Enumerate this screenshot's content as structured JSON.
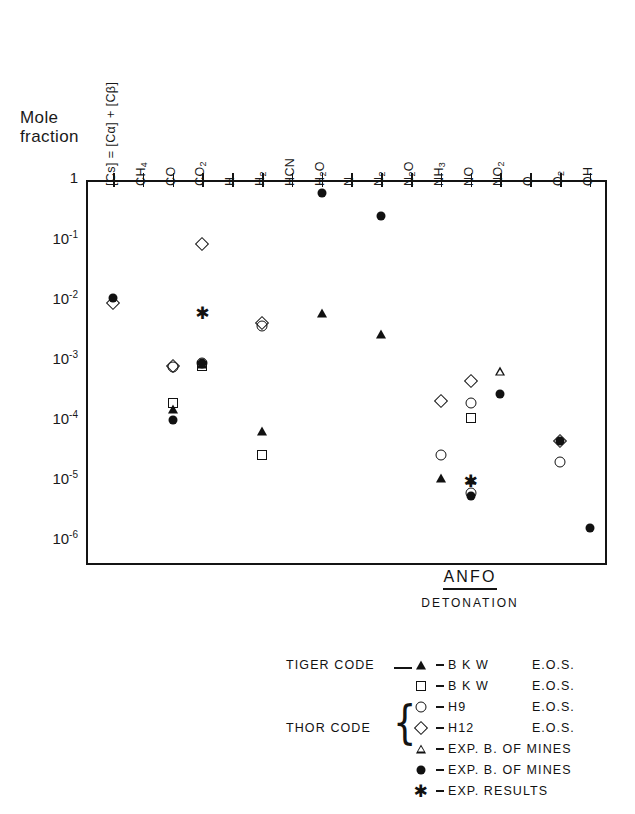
{
  "axes": {
    "y_title": "Mole\nfraction",
    "y_ticks": [
      "1",
      "-1",
      "-2",
      "-3",
      "-4",
      "-5",
      "-6"
    ],
    "y_base": "10",
    "x_labels": [
      "[Cs] = [Cα] + [Cβ]",
      "CH4",
      "CO",
      "CO2",
      "H",
      "H2",
      "HCN",
      "H2O",
      "N",
      "N2",
      "N2O",
      "NH3",
      "NO",
      "NO2",
      "O",
      "O2",
      "OH"
    ]
  },
  "annotation": {
    "title": "ANFO",
    "subtitle": "DETONATION"
  },
  "legend": {
    "tiger_label": "TIGER CODE",
    "thor_label": "THOR CODE",
    "rows": [
      {
        "symbol": "filled-triangle",
        "name": "B K W",
        "eos": "E.O.S."
      },
      {
        "symbol": "open-square",
        "name": "B K W",
        "eos": "E.O.S."
      },
      {
        "symbol": "open-circle",
        "name": "H9",
        "eos": "E.O.S."
      },
      {
        "symbol": "open-diamond",
        "name": "H12",
        "eos": "E.O.S."
      },
      {
        "symbol": "open-triangle",
        "name": "EXP. B. OF MINES",
        "eos": ""
      },
      {
        "symbol": "filled-circle",
        "name": "EXP. B. OF MINES",
        "eos": ""
      },
      {
        "symbol": "asterisk",
        "name": "EXP. RESULTS",
        "eos": ""
      }
    ]
  },
  "chart_data": {
    "type": "scatter",
    "title": "ANFO DETONATION",
    "xlabel": "",
    "ylabel": "Mole fraction",
    "yscale": "log",
    "ylim": [
      1e-06,
      1
    ],
    "grid": false,
    "legend_position": "below-plot",
    "categories": [
      "[Cs] = [Cα] + [Cβ]",
      "CH4",
      "CO",
      "CO2",
      "H",
      "H2",
      "HCN",
      "H2O",
      "N",
      "N2",
      "N2O",
      "NH3",
      "NO",
      "NO2",
      "O",
      "O2",
      "OH"
    ],
    "series": [
      {
        "name": "TIGER CODE - B K W E.O.S.",
        "symbol": "filled-triangle",
        "points": [
          {
            "x": "CO",
            "y": 0.00015
          },
          {
            "x": "CO2",
            "y": 0.00085
          },
          {
            "x": "H2",
            "y": 6.5e-05
          },
          {
            "x": "H2O",
            "y": 0.006
          },
          {
            "x": "N2",
            "y": 0.0027
          },
          {
            "x": "NH3",
            "y": 1.1e-05
          },
          {
            "x": "NO",
            "y": 1e-05
          }
        ]
      },
      {
        "name": "THOR CODE - B K W E.O.S.",
        "symbol": "open-square",
        "points": [
          {
            "x": "CO",
            "y": 0.00019
          },
          {
            "x": "CO2",
            "y": 0.0008
          },
          {
            "x": "H2",
            "y": 2.6e-05
          },
          {
            "x": "NO",
            "y": 0.00011
          }
        ]
      },
      {
        "name": "THOR CODE - H9 E.O.S.",
        "symbol": "open-circle",
        "points": [
          {
            "x": "CO",
            "y": 0.00075
          },
          {
            "x": "CO2",
            "y": 0.0009
          },
          {
            "x": "H2",
            "y": 0.0037
          },
          {
            "x": "NH3",
            "y": 2.6e-05
          },
          {
            "x": "NO",
            "y": 0.00019
          },
          {
            "x": "NO",
            "y": 6e-06
          },
          {
            "x": "O2",
            "y": 2e-05
          }
        ]
      },
      {
        "name": "THOR CODE - H12 E.O.S.",
        "symbol": "open-diamond",
        "points": [
          {
            "x": "[Cs] = [Cα] + [Cβ]",
            "y": 0.009
          },
          {
            "x": "CO",
            "y": 0.00078
          },
          {
            "x": "CO2",
            "y": 0.085
          },
          {
            "x": "H2",
            "y": 0.0042
          },
          {
            "x": "NH3",
            "y": 0.00021
          },
          {
            "x": "NO",
            "y": 0.00044
          },
          {
            "x": "O2",
            "y": 4.5e-05
          }
        ]
      },
      {
        "name": "EXP. B. OF MINES (open triangle)",
        "symbol": "open-triangle",
        "points": [
          {
            "x": "NO2",
            "y": 0.00065
          }
        ]
      },
      {
        "name": "EXP. B. OF MINES (filled circle)",
        "symbol": "filled-circle",
        "points": [
          {
            "x": "[Cs] = [Cα] + [Cβ]",
            "y": 0.011
          },
          {
            "x": "CO",
            "y": 0.0001
          },
          {
            "x": "CO2",
            "y": 0.0009
          },
          {
            "x": "H2O",
            "y": 0.6
          },
          {
            "x": "N2",
            "y": 0.25
          },
          {
            "x": "NO",
            "y": 5.5e-06
          },
          {
            "x": "NO2",
            "y": 0.00027
          },
          {
            "x": "O2",
            "y": 4.5e-05
          },
          {
            "x": "OH",
            "y": 1.6e-06
          }
        ]
      },
      {
        "name": "EXP. RESULTS (asterisk)",
        "symbol": "asterisk",
        "points": [
          {
            "x": "CO2",
            "y": 0.006
          },
          {
            "x": "NO",
            "y": 9.5e-06
          }
        ]
      }
    ]
  },
  "geometry": {
    "plot_left": 86,
    "plot_right": 607,
    "plot_top": 180,
    "plot_bottom": 565,
    "decade_px": 60,
    "first_tick_x": 113,
    "tick_step": 29.8
  }
}
